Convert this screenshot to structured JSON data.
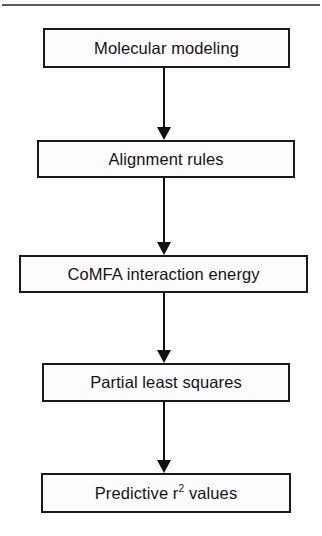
{
  "figure": {
    "orientation": "vertical top-to-bottom",
    "background_color": "#ffffff",
    "line_color": "#111111",
    "box_fill_color": "#fcfcfc",
    "top_rule": {
      "name": "horizontal-rule",
      "color": "#5a5a5a"
    }
  },
  "nodes": [
    {
      "id": "molecular-modeling",
      "label": "Molecular modeling",
      "x": 43,
      "y": 28,
      "w": 247,
      "h": 40
    },
    {
      "id": "alignment-rules",
      "label": "Alignment rules",
      "x": 37,
      "y": 140,
      "w": 258,
      "h": 38
    },
    {
      "id": "comfa-interaction-energy",
      "label": "CoMFA interaction energy",
      "x": 19,
      "y": 255,
      "w": 289,
      "h": 38
    },
    {
      "id": "partial-least-squares",
      "label": "Partial least squares",
      "x": 42,
      "y": 363,
      "w": 248,
      "h": 39
    },
    {
      "id": "predictive-r2-values",
      "label_prefix": "Predictive r",
      "label_superscript": "2",
      "label_suffix": " values",
      "label": "Predictive r2 values",
      "x": 41,
      "y": 473,
      "w": 250,
      "h": 40
    }
  ],
  "arrows": [
    {
      "id": "arrow-1",
      "from": "molecular-modeling",
      "to": "alignment-rules",
      "x": 163,
      "y": 68,
      "length": 72
    },
    {
      "id": "arrow-2",
      "from": "alignment-rules",
      "to": "comfa-interaction-energy",
      "x": 163,
      "y": 178,
      "length": 77
    },
    {
      "id": "arrow-3",
      "from": "comfa-interaction-energy",
      "to": "partial-least-squares",
      "x": 163,
      "y": 293,
      "length": 70
    },
    {
      "id": "arrow-4",
      "from": "partial-least-squares",
      "to": "predictive-r2-values",
      "x": 163,
      "y": 402,
      "length": 71
    }
  ]
}
